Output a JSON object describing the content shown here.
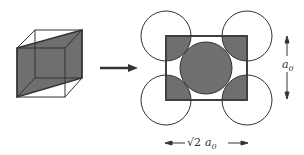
{
  "diagram": {
    "colors": {
      "shade": "#6f6f6f",
      "line": "#333333",
      "bg": "#ffffff"
    },
    "labels": {
      "height_symbol": "a",
      "height_sub": "0",
      "width_prefix": "√2",
      "width_symbol": "a",
      "width_sub": "0"
    }
  }
}
